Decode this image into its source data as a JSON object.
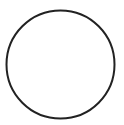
{
  "figure": {
    "shape": "circle",
    "center": [
      60.5,
      64.5
    ],
    "radius": 54,
    "stroke_color": "#222222",
    "stroke_width": 2,
    "fill": "#ffffff"
  }
}
